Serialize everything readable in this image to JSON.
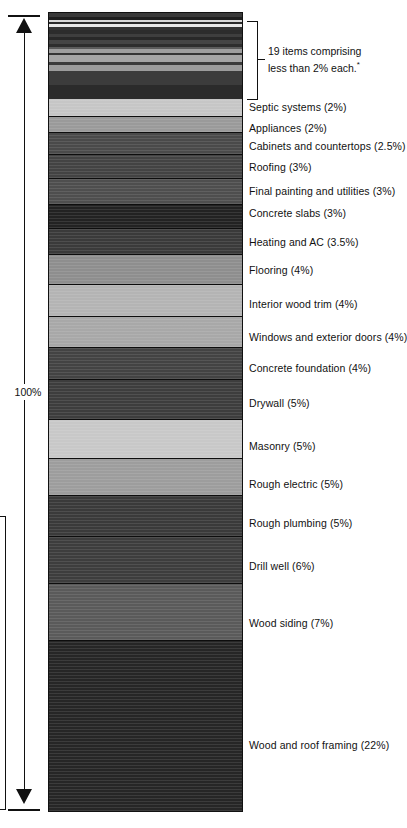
{
  "figure": {
    "axis": {
      "total_label": "100%",
      "arrow_top_icon": "arrow-up-icon",
      "arrow_bottom_icon": "arrow-down-icon"
    },
    "callout": {
      "line1": "19 items comprising",
      "line2": "less than 2% each.",
      "footnote_marker": "*"
    },
    "cropped_neighbor_text": ")"
  },
  "chart_data": {
    "type": "bar",
    "orientation": "vertical-stacked",
    "title": "",
    "subtitle": "",
    "xlabel": "",
    "ylabel": "",
    "total": 100,
    "units": "percent of cost",
    "ylim": [
      0,
      100
    ],
    "grid": false,
    "legend": "right-of-bar-inline-labels",
    "annotations": [
      "19 items comprising less than 2% each.*",
      "100%"
    ],
    "categories": [
      "19 items comprising less than 2% each.*",
      "Septic systems",
      "Appliances",
      "Cabinets and countertops",
      "Roofing",
      "Final painting and utilities",
      "Concrete slabs",
      "Heating and AC",
      "Flooring",
      "Interior wood trim",
      "Windows and exterior doors",
      "Concrete foundation",
      "Drywall",
      "Masonry",
      "Rough electric",
      "Rough plumbing",
      "Drill well",
      "Wood siding",
      "Wood and roof framing"
    ],
    "values": [
      11,
      2,
      2,
      2.5,
      3,
      3,
      3,
      3.5,
      4,
      4,
      4,
      4,
      5,
      5,
      5,
      5,
      6,
      7,
      22
    ]
  },
  "segments": [
    {
      "label": "",
      "value": 11,
      "height_px": 86,
      "color": "#3f3f3f",
      "striped": true,
      "label_y": 0,
      "show_label": false
    },
    {
      "label": "Septic systems (2%)",
      "value": 2,
      "height_px": 19,
      "color": "#c6c6c6",
      "striped": false,
      "label_y": 101,
      "show_label": true
    },
    {
      "label": "Appliances (2%)",
      "value": 2,
      "height_px": 16,
      "color": "#9a9a9a",
      "striped": false,
      "label_y": 122,
      "show_label": true
    },
    {
      "label": "Cabinets and countertops (2.5%)",
      "value": 2.5,
      "height_px": 23,
      "color": "#4a4a4a",
      "striped": false,
      "label_y": 140,
      "show_label": true
    },
    {
      "label": "Roofing (3%)",
      "value": 3,
      "height_px": 25,
      "color": "#434343",
      "striped": false,
      "label_y": 161,
      "show_label": true
    },
    {
      "label": "Final painting and utilities (3%)",
      "value": 3,
      "height_px": 26,
      "color": "#4e4e4e",
      "striped": false,
      "label_y": 185,
      "show_label": true
    },
    {
      "label": "Concrete slabs (3%)",
      "value": 3,
      "height_px": 25,
      "color": "#222222",
      "striped": false,
      "label_y": 207,
      "show_label": true
    },
    {
      "label": "Heating and AC (3.5%)",
      "value": 3.5,
      "height_px": 27,
      "color": "#3a3a3a",
      "striped": false,
      "label_y": 236,
      "show_label": true
    },
    {
      "label": "Flooring (4%)",
      "value": 4,
      "height_px": 31,
      "color": "#8e8e8e",
      "striped": false,
      "label_y": 264,
      "show_label": true
    },
    {
      "label": "Interior wood trim (4%)",
      "value": 4,
      "height_px": 33,
      "color": "#b4b4b4",
      "striped": false,
      "label_y": 298,
      "show_label": true
    },
    {
      "label": "Windows and exterior doors (4%)",
      "value": 4,
      "height_px": 32,
      "color": "#a8a8a8",
      "striped": false,
      "label_y": 331,
      "show_label": true
    },
    {
      "label": "Concrete foundation (4%)",
      "value": 4,
      "height_px": 33,
      "color": "#434343",
      "striped": false,
      "label_y": 362,
      "show_label": true
    },
    {
      "label": "Drywall (5%)",
      "value": 5,
      "height_px": 41,
      "color": "#3d3d3d",
      "striped": false,
      "label_y": 397,
      "show_label": true
    },
    {
      "label": "Masonry (5%)",
      "value": 5,
      "height_px": 41,
      "color": "#c8c8c8",
      "striped": false,
      "label_y": 440,
      "show_label": true
    },
    {
      "label": "Rough electric (5%)",
      "value": 5,
      "height_px": 38,
      "color": "#9d9d9d",
      "striped": false,
      "label_y": 478,
      "show_label": true
    },
    {
      "label": "Rough plumbing (5%)",
      "value": 5,
      "height_px": 42,
      "color": "#3a3a3a",
      "striped": false,
      "label_y": 517,
      "show_label": true
    },
    {
      "label": "Drill well (6%)",
      "value": 6,
      "height_px": 49,
      "color": "#3d3d3d",
      "striped": false,
      "label_y": 560,
      "show_label": true
    },
    {
      "label": "Wood siding (7%)",
      "value": 7,
      "height_px": 58,
      "color": "#5a5a5a",
      "striped": false,
      "label_y": 617,
      "show_label": true
    },
    {
      "label": "Wood and roof framing (22%)",
      "value": 22,
      "height_px": 176,
      "color": "#262626",
      "striped": false,
      "label_y": 739,
      "show_label": true
    }
  ],
  "micro_bands": [
    {
      "color": "#3a3a3a",
      "h": 4
    },
    {
      "color": "#1f1f1f",
      "h": 3
    },
    {
      "color": "#d8d8d8",
      "h": 2
    },
    {
      "color": "#2a2a2a",
      "h": 2
    },
    {
      "color": "#e8e8e8",
      "h": 3
    },
    {
      "color": "#333333",
      "h": 3
    },
    {
      "color": "#2c2c2c",
      "h": 4
    },
    {
      "color": "#3e3e3e",
      "h": 3
    },
    {
      "color": "#282828",
      "h": 3
    },
    {
      "color": "#454545",
      "h": 4
    },
    {
      "color": "#2e2e2e",
      "h": 3
    },
    {
      "color": "#5c5c5c",
      "h": 2
    },
    {
      "color": "#9e9e9e",
      "h": 4
    },
    {
      "color": "#343434",
      "h": 2
    },
    {
      "color": "#a5a5a5",
      "h": 7
    },
    {
      "color": "#3b3b3b",
      "h": 3
    },
    {
      "color": "#9c9c9c",
      "h": 6
    },
    {
      "color": "#3c3c3c",
      "h": 14
    },
    {
      "color": "#2b2b2b",
      "h": 14
    }
  ]
}
